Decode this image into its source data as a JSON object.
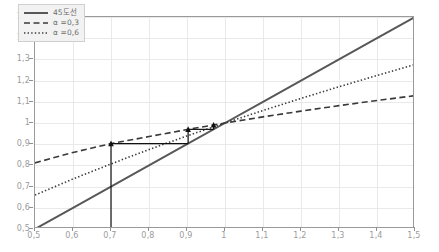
{
  "chart_data": {
    "type": "line",
    "title": "",
    "xlabel": "",
    "ylabel": "",
    "xlim": [
      0.5,
      1.5
    ],
    "ylim": [
      0.5,
      1.5
    ],
    "grid": true,
    "legend_position": "top-left",
    "decimal_separator": ",",
    "x_ticks": [
      "0,5",
      "0,6",
      "0,7",
      "0,8",
      "0,9",
      "1",
      "1,1",
      "1,2",
      "1,3",
      "1,4",
      "1,5"
    ],
    "x_tick_values": [
      0.5,
      0.6,
      0.7,
      0.8,
      0.9,
      1.0,
      1.1,
      1.2,
      1.3,
      1.4,
      1.5
    ],
    "y_ticks": [
      "0,5",
      "0,6",
      "0,7",
      "0,8",
      "0,9",
      "1",
      "1,1",
      "1,2",
      "1,3",
      "1,4",
      "1,5"
    ],
    "y_tick_values": [
      0.5,
      0.6,
      0.7,
      0.8,
      0.9,
      1.0,
      1.1,
      1.2,
      1.3,
      1.4,
      1.5
    ],
    "x": [
      0.5,
      0.6,
      0.7,
      0.8,
      0.9,
      1.0,
      1.1,
      1.2,
      1.3,
      1.4,
      1.5
    ],
    "series": [
      {
        "name": "45도선",
        "style": "solid",
        "color": "#58585a",
        "width": 2.0,
        "values": [
          0.5,
          0.6,
          0.7,
          0.8,
          0.9,
          1.0,
          1.1,
          1.2,
          1.3,
          1.4,
          1.5
        ]
      },
      {
        "name": "α =0,3",
        "style": "dashed",
        "color": "#3a3a3a",
        "width": 1.6,
        "alpha": 0.3,
        "values": [
          0.812,
          0.861,
          0.903,
          0.936,
          0.969,
          1.0,
          1.029,
          1.056,
          1.082,
          1.106,
          1.129
        ]
      },
      {
        "name": "α =0,6",
        "style": "dotted",
        "color": "#3a3a3a",
        "width": 1.6,
        "alpha": 0.6,
        "values": [
          0.66,
          0.736,
          0.807,
          0.875,
          0.939,
          1.0,
          1.059,
          1.116,
          1.171,
          1.224,
          1.276
        ]
      }
    ],
    "annotations": [
      {
        "name": "vertical-arrow-1",
        "type": "arrow",
        "x1": 0.7,
        "y1": 0.5,
        "x2": 0.7,
        "y2": 0.903
      },
      {
        "name": "horizontal-connector",
        "type": "line",
        "x1": 0.7,
        "y1": 0.903,
        "x2": 0.903,
        "y2": 0.903
      },
      {
        "name": "vertical-arrow-2",
        "type": "arrow",
        "x1": 0.903,
        "y1": 0.903,
        "x2": 0.903,
        "y2": 0.97
      },
      {
        "name": "horizontal-connector-2",
        "type": "line",
        "x1": 0.903,
        "y1": 0.97,
        "x2": 0.97,
        "y2": 0.97
      },
      {
        "name": "vertical-arrow-3",
        "type": "arrow",
        "x1": 0.97,
        "y1": 0.97,
        "x2": 0.97,
        "y2": 0.991
      }
    ]
  },
  "legend": {
    "items": [
      {
        "label": "45도선",
        "style": "solid"
      },
      {
        "label": "α =0,3",
        "style": "dashed"
      },
      {
        "label": "α =0,6",
        "style": "dotted"
      }
    ]
  }
}
